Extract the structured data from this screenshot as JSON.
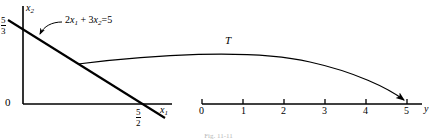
{
  "figure": {
    "caption": "Fig. 11-11",
    "left_plot": {
      "origin_label": "0",
      "y_axis_label": "x",
      "y_axis_sub": "2",
      "x_axis_label": "x",
      "x_axis_sub": "1",
      "y_intercept": {
        "num": "5",
        "den": "3"
      },
      "x_intercept": {
        "num": "5",
        "den": "2"
      },
      "equation": "2 x₁ + 3x₂ = 5",
      "equation_parts": {
        "c1": "2",
        "v1": "x",
        "s1": "1",
        "plus": "+",
        "c2": "3",
        "v2": "x",
        "s2": "2",
        "eq": "=",
        "rhs": "5"
      }
    },
    "right_plot": {
      "axis_label": "y",
      "curve_label": "T",
      "ticks": [
        "0",
        "1",
        "2",
        "3",
        "4",
        "5"
      ],
      "arrow_target": "5"
    },
    "colors": {
      "ink": "#000000",
      "caption": "#b8b8b8"
    }
  }
}
